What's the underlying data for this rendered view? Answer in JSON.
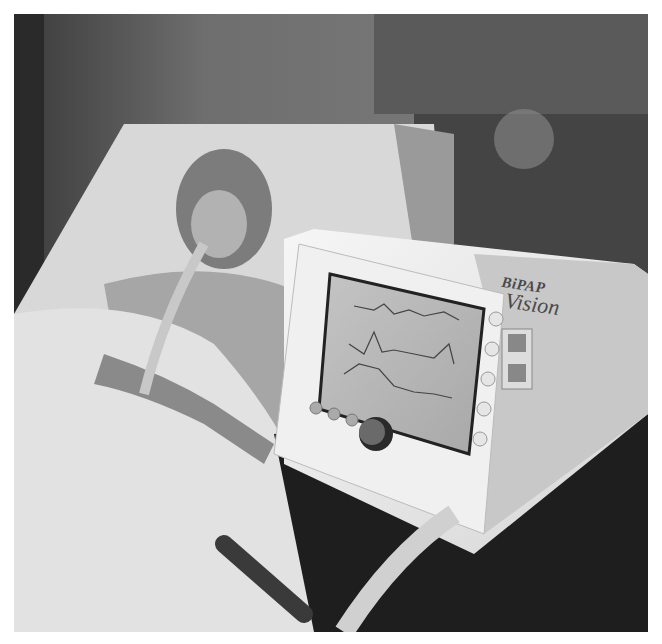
{
  "image": {
    "description": "Grayscale photo of a patient in a hospital bed wearing a full-face mask connected to a BiPAP Vision ventilator with a waveform display screen",
    "colors": {
      "border": "#ffffff",
      "wall": "#6a6a6a",
      "pillow": "#dcdcdc",
      "device": "#ececec",
      "screen": "#b8b8b8",
      "cabinet": "#1e1e1e"
    }
  },
  "device": {
    "brand_line1": "BiPAP",
    "brand_line2": "Vision"
  }
}
